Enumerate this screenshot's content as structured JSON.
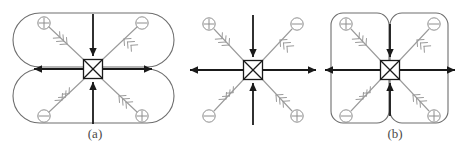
{
  "figure": {
    "width": 457,
    "height": 148,
    "background": "#ffffff",
    "type": "physics-schematic"
  },
  "colors": {
    "black": "#1a1a1a",
    "gray": "#9a9a9a",
    "outline": "#6e6e6e",
    "caption": "#4a4a4a",
    "background": "#ffffff"
  },
  "captions": [
    {
      "id": "cap-a",
      "text": "(a)"
    },
    {
      "id": "cap-b",
      "text": "(b)"
    }
  ],
  "panels": [
    {
      "id": "panel-a",
      "label": "(a)",
      "center": [
        93,
        69
      ],
      "enclosure": "two-horizontal-stadium-lobes-stacked-vertically",
      "lobes": 2,
      "lobe_orientation": "horizontal",
      "symbols": [
        {
          "position": "top-left",
          "glyph": "plus-circle",
          "sign": "+",
          "arrow_direction": "toward-center"
        },
        {
          "position": "top-right",
          "glyph": "minus-circle",
          "sign": "-",
          "arrow_direction": "away-from-center"
        },
        {
          "position": "bottom-left",
          "glyph": "minus-circle",
          "sign": "-",
          "arrow_direction": "away-from-center"
        },
        {
          "position": "bottom-right",
          "glyph": "plus-circle",
          "sign": "+",
          "arrow_direction": "toward-center"
        }
      ],
      "black_arrows": [
        {
          "axis": "top",
          "direction": "down-into-center"
        },
        {
          "axis": "bottom",
          "direction": "up-into-center"
        },
        {
          "axis": "left",
          "direction": "left-outward"
        },
        {
          "axis": "right",
          "direction": "right-outward"
        }
      ]
    },
    {
      "id": "panel-middle",
      "label": "",
      "center": [
        253,
        70
      ],
      "enclosure": "none",
      "lobes": 0,
      "lobe_orientation": "none",
      "symbols": [
        {
          "position": "top-left",
          "glyph": "plus-circle",
          "sign": "+",
          "arrow_direction": "toward-center"
        },
        {
          "position": "top-right",
          "glyph": "minus-circle",
          "sign": "-",
          "arrow_direction": "away-from-center"
        },
        {
          "position": "bottom-left",
          "glyph": "minus-circle",
          "sign": "-",
          "arrow_direction": "away-from-center"
        },
        {
          "position": "bottom-right",
          "glyph": "plus-circle",
          "sign": "+",
          "arrow_direction": "toward-center"
        }
      ],
      "black_arrows": [
        {
          "axis": "top",
          "direction": "down-into-center"
        },
        {
          "axis": "bottom",
          "direction": "up-into-center"
        },
        {
          "axis": "left",
          "direction": "left-outward"
        },
        {
          "axis": "right",
          "direction": "right-outward"
        }
      ]
    },
    {
      "id": "panel-b",
      "label": "(b)",
      "center": [
        390,
        69
      ],
      "enclosure": "two-vertical-rounded-rectangles-side-by-side",
      "lobes": 2,
      "lobe_orientation": "vertical",
      "symbols": [
        {
          "position": "top-left",
          "glyph": "plus-circle",
          "sign": "+",
          "arrow_direction": "toward-center"
        },
        {
          "position": "top-right",
          "glyph": "minus-circle",
          "sign": "-",
          "arrow_direction": "away-from-center"
        },
        {
          "position": "bottom-left",
          "glyph": "minus-circle",
          "sign": "-",
          "arrow_direction": "away-from-center"
        },
        {
          "position": "bottom-right",
          "glyph": "plus-circle",
          "sign": "+",
          "arrow_direction": "toward-center"
        }
      ],
      "black_arrows": [
        {
          "axis": "top",
          "direction": "down-into-center"
        },
        {
          "axis": "bottom",
          "direction": "up-into-center"
        },
        {
          "axis": "left",
          "direction": "left-outward"
        },
        {
          "axis": "right",
          "direction": "right-outward"
        }
      ]
    }
  ],
  "center_node": {
    "name": "crossed-square-vertex",
    "shape": "square-with-x-diagonals",
    "size": 19
  }
}
